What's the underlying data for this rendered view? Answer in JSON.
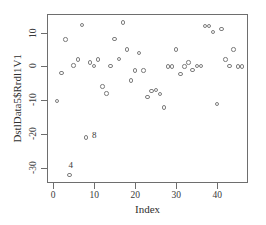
{
  "chart_data": {
    "type": "scatter",
    "title": "",
    "xlabel": "Index",
    "ylabel": "DstlData5$Rrdl1V1",
    "xlim": [
      -1.5,
      47.5
    ],
    "ylim": [
      -34.5,
      15.5
    ],
    "xticks": [
      0,
      10,
      20,
      30,
      40
    ],
    "yticks": [
      10,
      0,
      -10,
      -20,
      -30
    ],
    "xtick_labels": [
      "0",
      "10",
      "20",
      "30",
      "40"
    ],
    "ytick_labels": [
      "10",
      "0",
      "-10",
      "-20",
      "-30"
    ],
    "grid": false,
    "legend": null,
    "marker": "open-circle",
    "marker_color": "#7d7d7d",
    "x": [
      1,
      2,
      3,
      4,
      5,
      6,
      7,
      8,
      9,
      10,
      11,
      12,
      13,
      14,
      15,
      16,
      17,
      18,
      19,
      20,
      21,
      22,
      23,
      24,
      25,
      26,
      27,
      28,
      29,
      30,
      31,
      32,
      33,
      34,
      35,
      36,
      37,
      38,
      39,
      40,
      41,
      42,
      43,
      44,
      45,
      46
    ],
    "y": [
      -10.2,
      -2.0,
      8.0,
      -32.2,
      0.3,
      2.0,
      12.2,
      -21.0,
      1.2,
      0.2,
      2.0,
      -6.0,
      -8.0,
      0.2,
      8.1,
      2.1,
      13.0,
      5.0,
      -4.2,
      -1.2,
      4.0,
      -1.2,
      -9.1,
      -7.2,
      -7.0,
      -8.1,
      -12.2,
      0.0,
      0.0,
      5.0,
      -2.2,
      0.0,
      1.2,
      -1.0,
      0.2,
      0.2,
      12.0,
      12.0,
      10.1,
      -11.2,
      11.0,
      2.0,
      0.2,
      5.0,
      0.0,
      0.0
    ],
    "annotations": [
      {
        "label": "8",
        "x": 8,
        "y": -21.0,
        "dx": 6,
        "dy": -1
      },
      {
        "label": "4",
        "x": 4,
        "y": -32.2,
        "dx": -1,
        "dy": -9
      }
    ]
  }
}
